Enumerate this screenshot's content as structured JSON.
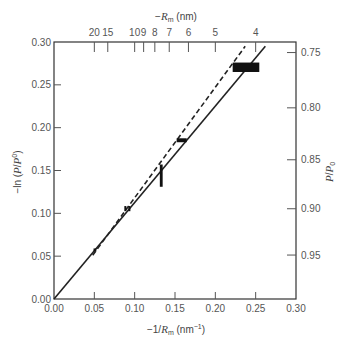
{
  "chart_data": {
    "type": "line",
    "title": "",
    "xlabel": "−1/Rm (nm−1)",
    "ylabel": "−ln (P/P0)",
    "xlim": [
      0.0,
      0.3
    ],
    "ylim": [
      0.0,
      0.3
    ],
    "grid": false,
    "legend": "none",
    "x_ticks": [
      0.0,
      0.05,
      0.1,
      0.15,
      0.2,
      0.25,
      0.3
    ],
    "x_tick_labels": [
      "0.00",
      "0.05",
      "0.10",
      "0.15",
      "0.20",
      "0.25",
      "0.30"
    ],
    "y_ticks": [
      0.0,
      0.05,
      0.1,
      0.15,
      0.2,
      0.25,
      0.3
    ],
    "y_tick_labels": [
      "0.00",
      "0.05",
      "0.10",
      "0.15",
      "0.20",
      "0.25",
      "0.30"
    ],
    "xlabel_parts": {
      "pre": "−1/",
      "var": "R",
      "sub": "m",
      "unit": " (nm",
      "sup": "−1",
      "post": ")"
    },
    "ylabel_parts": {
      "pre": "−ln (",
      "var1": "P",
      "slash": "/",
      "var2": "P",
      "sup": "0",
      "post": ")"
    },
    "top_axis": {
      "label": "−Rm (nm)",
      "label_parts": {
        "pre": "−",
        "var": "R",
        "sub": "m",
        "unit": " (nm)"
      },
      "mapping": "x = 1/R",
      "ticks": [
        20,
        15,
        10,
        9,
        8,
        7,
        6,
        5,
        4
      ],
      "tick_labels": [
        "20",
        "15",
        "10",
        "9",
        "8",
        "7",
        "6",
        "5",
        "4"
      ]
    },
    "right_axis": {
      "label": "P/P0",
      "label_parts": {
        "var1": "P",
        "slash": "/",
        "var2": "P",
        "sub": "0"
      },
      "mapping": "y = −ln(P/P0)",
      "ticks": [
        0.75,
        0.8,
        0.85,
        0.9,
        0.95
      ],
      "tick_labels": [
        "0.75",
        "0.80",
        "0.85",
        "0.90",
        "0.95"
      ]
    },
    "series": [
      {
        "name": "solid-line",
        "style": "solid",
        "x": [
          0.0,
          0.262
        ],
        "y": [
          0.0,
          0.295
        ]
      },
      {
        "name": "dashed-line",
        "style": "dashed",
        "x": [
          0.048,
          0.237
        ],
        "y": [
          0.051,
          0.295
        ]
      }
    ],
    "points": [
      {
        "x": [
          0.049,
          0.0525
        ],
        "y": [
          0.0555,
          0.059
        ]
      },
      {
        "x": [
          0.0872,
          0.0897
        ],
        "y": [
          0.1025,
          0.1085
        ]
      },
      {
        "x": [
          0.0922,
          0.0947
        ],
        "y": [
          0.1025,
          0.1085
        ]
      },
      {
        "x": [
          0.1312,
          0.1347
        ],
        "y": [
          0.131,
          0.157
        ]
      },
      {
        "x": [
          0.152,
          0.1645
        ],
        "y": [
          0.183,
          0.1876
        ]
      },
      {
        "x": [
          0.2215,
          0.2545
        ],
        "y": [
          0.265,
          0.276
        ]
      }
    ]
  }
}
